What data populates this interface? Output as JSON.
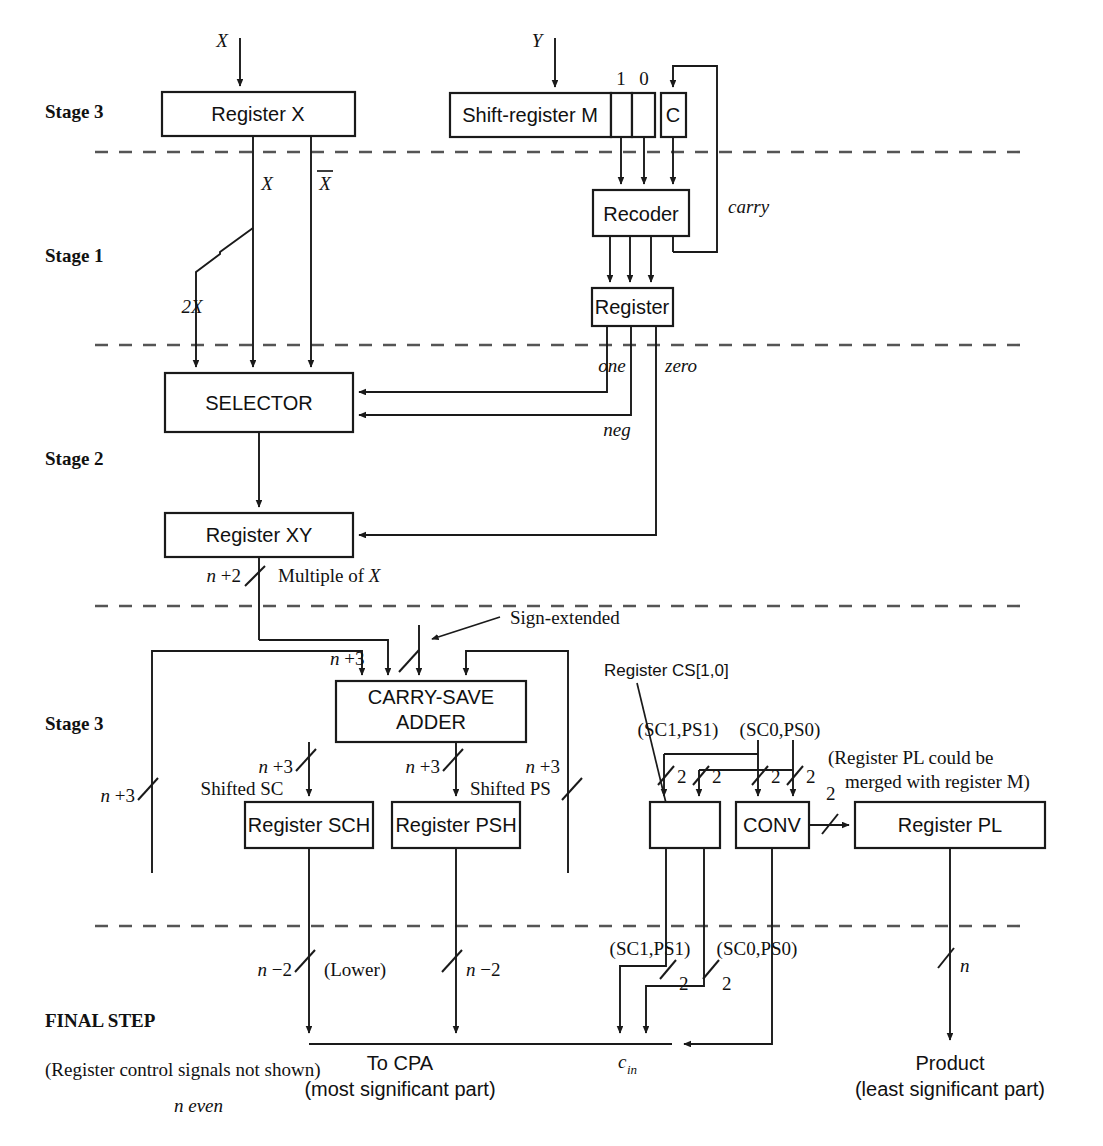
{
  "colors": {
    "line": "#1a1a1a",
    "dashed": "#555555",
    "background": "#ffffff"
  },
  "stage_labels": [
    {
      "text": "Stage 3",
      "x": 45,
      "y": 118
    },
    {
      "text": "Stage 1",
      "x": 45,
      "y": 262
    },
    {
      "text": "Stage 2",
      "x": 45,
      "y": 465
    },
    {
      "text": "Stage 3",
      "x": 45,
      "y": 730
    },
    {
      "text": "FINAL STEP",
      "x": 45,
      "y": 1027
    }
  ],
  "blocks": [
    {
      "name": "register-x",
      "label": "Register X",
      "x": 162,
      "y": 92,
      "w": 193,
      "h": 44
    },
    {
      "name": "shift-register-m",
      "label": "Shift-register M",
      "x": 450,
      "y": 93,
      "w": 161,
      "h": 44
    },
    {
      "name": "m-cell-1",
      "label": "",
      "x": 611,
      "y": 93,
      "w": 21,
      "h": 44
    },
    {
      "name": "m-cell-0",
      "label": "",
      "x": 632,
      "y": 93,
      "w": 23,
      "h": 44
    },
    {
      "name": "carry-flipflop-c",
      "label": "C",
      "x": 661,
      "y": 93,
      "w": 25,
      "h": 44
    },
    {
      "name": "recoder",
      "label": "Recoder",
      "x": 593,
      "y": 190,
      "w": 96,
      "h": 46
    },
    {
      "name": "recode-register",
      "label": "Register",
      "x": 592,
      "y": 288,
      "w": 81,
      "h": 38
    },
    {
      "name": "selector",
      "label": "SELECTOR",
      "x": 165,
      "y": 373,
      "w": 188,
      "h": 59
    },
    {
      "name": "register-xy",
      "label": "Register XY",
      "x": 165,
      "y": 513,
      "w": 188,
      "h": 44
    },
    {
      "name": "carry-save-adder",
      "label": "CARRY-SAVE\nADDER",
      "x": 336,
      "y": 681,
      "w": 190,
      "h": 61
    },
    {
      "name": "register-sch",
      "label": "Register SCH",
      "x": 245,
      "y": 802,
      "w": 128,
      "h": 46
    },
    {
      "name": "register-psh",
      "label": "Register PSH",
      "x": 392,
      "y": 802,
      "w": 128,
      "h": 46
    },
    {
      "name": "register-cs",
      "label": "",
      "x": 650,
      "y": 802,
      "w": 70,
      "h": 46
    },
    {
      "name": "conv",
      "label": "CONV",
      "x": 736,
      "y": 802,
      "w": 73,
      "h": 46
    },
    {
      "name": "register-pl",
      "label": "Register PL",
      "x": 855,
      "y": 802,
      "w": 190,
      "h": 46
    }
  ],
  "m_cell_bit_labels": [
    {
      "text": "1",
      "x": 621,
      "y": 85
    },
    {
      "text": "0",
      "x": 643,
      "y": 85
    }
  ],
  "signal_labels": [
    {
      "name": "input-x",
      "text": "X",
      "x": 222,
      "y": 47,
      "style": "ital"
    },
    {
      "name": "input-y",
      "text": "Y",
      "x": 537,
      "y": 47,
      "style": "ital"
    },
    {
      "name": "x-true",
      "text": "X",
      "x": 265,
      "y": 186,
      "style": "ital"
    },
    {
      "name": "x-complement",
      "text": "X",
      "x": 320,
      "y": 186,
      "style": "ital-overbar"
    },
    {
      "name": "two-x",
      "text": "2X",
      "x": 192,
      "y": 313,
      "style": "ital"
    },
    {
      "name": "carry",
      "text": "carry",
      "x": 728,
      "y": 213,
      "style": "ital"
    },
    {
      "name": "one",
      "text": "one",
      "x": 612,
      "y": 372,
      "style": "ital"
    },
    {
      "name": "zero",
      "text": "zero",
      "x": 679,
      "y": 372,
      "style": "ital"
    },
    {
      "name": "neg",
      "text": "neg",
      "x": 616,
      "y": 435,
      "style": "ital"
    },
    {
      "name": "multiple-of-x",
      "text": "Multiple of X",
      "x": 228,
      "y": 575,
      "style": "serif"
    },
    {
      "name": "sign-extended",
      "text": "Sign-extended",
      "x": 416,
      "y": 629,
      "style": "serif"
    },
    {
      "name": "shifted-sc",
      "text": "Shifted SC",
      "x": 231,
      "y": 791,
      "style": "serif"
    },
    {
      "name": "shifted-ps",
      "text": "Shifted PS",
      "x": 460,
      "y": 791,
      "style": "serif"
    },
    {
      "name": "register-cs-caption",
      "text": "Register CS[1,0]",
      "x": 604,
      "y": 672,
      "style": "sans17"
    },
    {
      "name": "sc1-ps1-upper",
      "text": "(SC1,PS1)",
      "x": 637,
      "y": 740,
      "style": "serif"
    },
    {
      "name": "sc0-ps0-upper",
      "text": "(SC0,PS0)",
      "x": 735,
      "y": 740,
      "style": "serif"
    },
    {
      "name": "sc1-ps1-lower",
      "text": "(SC1,PS1)",
      "x": 607,
      "y": 951,
      "style": "serif"
    },
    {
      "name": "sc0-ps0-lower",
      "text": "(SC0,PS0)",
      "x": 712,
      "y": 951,
      "style": "serif"
    },
    {
      "name": "pl-merge-note",
      "text": "(Register PL could be",
      "x": 828,
      "y": 760,
      "style": "serif"
    },
    {
      "name": "pl-merge-note-2",
      "text": "merged with register M)",
      "x": 844,
      "y": 783,
      "style": "serif"
    },
    {
      "name": "lower",
      "text": "(Lower)",
      "x": 340,
      "y": 971,
      "style": "serif"
    },
    {
      "name": "carry-in",
      "text": "cin",
      "x": 625,
      "y": 1062,
      "style": "ital-sub"
    },
    {
      "name": "to-cpa",
      "text": "To CPA",
      "x": 400,
      "y": 1062,
      "style": "sans"
    },
    {
      "name": "to-cpa-2",
      "text": "(most significant part)",
      "x": 400,
      "y": 1088,
      "style": "sans"
    },
    {
      "name": "product",
      "text": "Product",
      "x": 950,
      "y": 1062,
      "style": "sans"
    },
    {
      "name": "product-2",
      "text": "(least significant part)",
      "x": 950,
      "y": 1088,
      "style": "sans"
    },
    {
      "name": "control-note",
      "text": "(Register control signals not shown)",
      "x": 45,
      "y": 1070,
      "style": "serif"
    },
    {
      "name": "n-even",
      "text": "n even",
      "x": 174,
      "y": 1107,
      "style": "ital"
    }
  ],
  "bus_width_labels": [
    {
      "name": "bus-n-plus-2",
      "text": "n +2",
      "x": 196,
      "y": 577
    },
    {
      "name": "bus-n-plus-3-csa-in",
      "text": "n +3",
      "x": 344,
      "y": 660
    },
    {
      "name": "bus-n-plus-3-sc",
      "text": "n +3",
      "x": 252,
      "y": 768
    },
    {
      "name": "bus-n-plus-3-ps",
      "text": "n +3",
      "x": 400,
      "y": 768
    },
    {
      "name": "bus-n-plus-3-right",
      "text": "n +3",
      "x": 545,
      "y": 768
    },
    {
      "name": "bus-n-plus-3-left",
      "text": "n +3",
      "x": 120,
      "y": 790
    },
    {
      "name": "bus-2-a",
      "text": "2",
      "x": 684,
      "y": 775
    },
    {
      "name": "bus-2-b",
      "text": "2",
      "x": 718,
      "y": 775
    },
    {
      "name": "bus-2-c",
      "text": "2",
      "x": 767,
      "y": 775
    },
    {
      "name": "bus-2-d",
      "text": "2",
      "x": 803,
      "y": 775
    },
    {
      "name": "bus-2-conv-out",
      "text": "2",
      "x": 831,
      "y": 790
    },
    {
      "name": "bus-n-minus-2-sc",
      "text": "n −2",
      "x": 261,
      "y": 971
    },
    {
      "name": "bus-n-minus-2-ps",
      "text": "n −2",
      "x": 424,
      "y": 971
    },
    {
      "name": "bus-2-e",
      "text": "2",
      "x": 683,
      "y": 983
    },
    {
      "name": "bus-2-f",
      "text": "2",
      "x": 726,
      "y": 983
    },
    {
      "name": "bus-n-product",
      "text": "n",
      "x": 962,
      "y": 968
    }
  ],
  "dashed_dividers": [
    {
      "name": "divider-stage3-stage1",
      "y": 152,
      "x1": 95,
      "x2": 1028
    },
    {
      "name": "divider-stage1-stage2",
      "y": 345,
      "x1": 95,
      "x2": 1028
    },
    {
      "name": "divider-stage2-stage3",
      "y": 606,
      "x1": 95,
      "x2": 1028
    },
    {
      "name": "divider-stage3-final",
      "y": 926,
      "x1": 95,
      "x2": 1028
    }
  ]
}
